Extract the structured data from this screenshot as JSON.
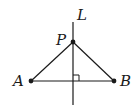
{
  "diagram": {
    "labels": {
      "line": "L",
      "point_p": "P",
      "point_a": "A",
      "point_b": "B"
    },
    "points": {
      "P": [
        73,
        42
      ],
      "A": [
        31,
        81
      ],
      "B": [
        114,
        81
      ]
    },
    "line_L": {
      "x": 73,
      "y1": 22,
      "y2": 105
    },
    "right_angle_marker": true,
    "stroke_color": "#1a1a1a"
  }
}
